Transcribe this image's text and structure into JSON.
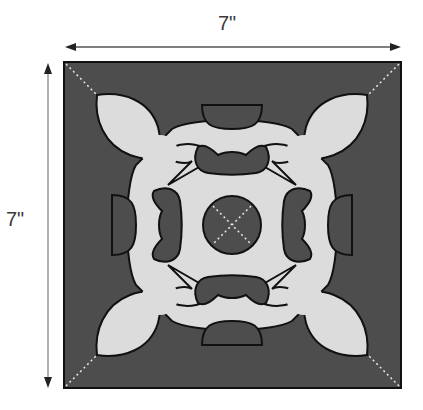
{
  "diagram": {
    "width_label": "7\"",
    "height_label": "7\"",
    "colors": {
      "background_fabric": "#4d4d4d",
      "applique_fabric": "#dcdcdc",
      "outline": "#111111",
      "dimension_line": "#555555",
      "guide_line": "#e8e8e8"
    },
    "elements": [
      "square block background",
      "central symmetric appliqué motif with four fleur-de-lis corners",
      "four inner reverse-appliqué openings",
      "central circle with dashed X",
      "dashed diagonal guide lines from corners"
    ]
  }
}
